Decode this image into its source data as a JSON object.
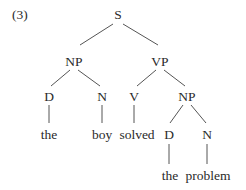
{
  "example_number": "(3)",
  "tree": {
    "root": "S",
    "nodes": {
      "s": {
        "label": "S",
        "x": 118,
        "y": 15
      },
      "np1": {
        "label": "NP",
        "x": 74,
        "y": 62
      },
      "vp": {
        "label": "VP",
        "x": 160,
        "y": 62
      },
      "d1": {
        "label": "D",
        "x": 49,
        "y": 97
      },
      "n1": {
        "label": "N",
        "x": 102,
        "y": 97
      },
      "v": {
        "label": "V",
        "x": 134,
        "y": 97
      },
      "np2": {
        "label": "NP",
        "x": 187,
        "y": 97
      },
      "w_the1": {
        "label": "the",
        "x": 49,
        "y": 135
      },
      "w_boy": {
        "label": "boy",
        "x": 102,
        "y": 135
      },
      "w_solved": {
        "label": "solved",
        "x": 136,
        "y": 135
      },
      "d2": {
        "label": "D",
        "x": 169,
        "y": 135
      },
      "n2": {
        "label": "N",
        "x": 207,
        "y": 135
      },
      "w_the2": {
        "label": "the",
        "x": 169,
        "y": 176
      },
      "w_problem": {
        "label": "problem",
        "x": 207,
        "y": 176
      }
    },
    "edges": [
      [
        "s",
        "np1"
      ],
      [
        "s",
        "vp"
      ],
      [
        "np1",
        "d1"
      ],
      [
        "np1",
        "n1"
      ],
      [
        "vp",
        "v"
      ],
      [
        "vp",
        "np2"
      ],
      [
        "d1",
        "w_the1"
      ],
      [
        "n1",
        "w_boy"
      ],
      [
        "v",
        "w_solved"
      ],
      [
        "np2",
        "d2"
      ],
      [
        "np2",
        "n2"
      ],
      [
        "d2",
        "w_the2"
      ],
      [
        "n2",
        "w_problem"
      ]
    ]
  }
}
